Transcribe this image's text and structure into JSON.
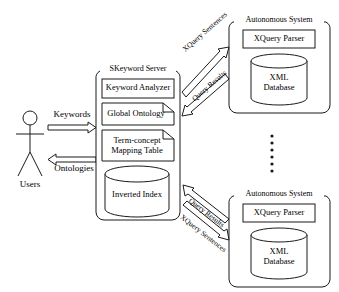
{
  "diagram": {
    "stroke_color": "#1a1a1a",
    "fill_color": "#ffffff"
  },
  "actor": {
    "label": "Users",
    "icon": "stick-figure-actor-icon"
  },
  "flows_user": [
    {
      "label": "Keywords",
      "direction": "right",
      "from": "actor",
      "to": "server"
    },
    {
      "label": "Ontologies",
      "direction": "left",
      "from": "server",
      "to": "actor"
    }
  ],
  "server": {
    "title": "SKeyword Server",
    "components": [
      {
        "label": "Keyword Analyzer",
        "shape": "rect"
      },
      {
        "label": "Global Ontology",
        "shape": "document"
      },
      {
        "label": "Term-concept\nMapping Table",
        "line1": "Term-concept",
        "line2": "Mapping Table",
        "shape": "document"
      },
      {
        "label": "Inverted Index",
        "shape": "cylinder"
      }
    ]
  },
  "autonomous_systems": [
    {
      "title": "Autonomous System",
      "parser": "XQuery Parser",
      "database_line1": "XML",
      "database_line2": "Database",
      "position": "top"
    },
    {
      "title": "Autonomous System",
      "parser": "XQuery Parser",
      "database_line1": "XML",
      "database_line2": "Database",
      "position": "bottom"
    }
  ],
  "flows_top": [
    {
      "label": "XQuery Sentences",
      "direction": "to-system"
    },
    {
      "label": "Query Results",
      "direction": "to-server"
    }
  ],
  "flows_bottom": [
    {
      "label": "Query Results",
      "direction": "to-server"
    },
    {
      "label": "XQuery Sentences",
      "direction": "to-system"
    }
  ],
  "ellipsis": {
    "symbol": "vertical-dots",
    "count": 6
  }
}
